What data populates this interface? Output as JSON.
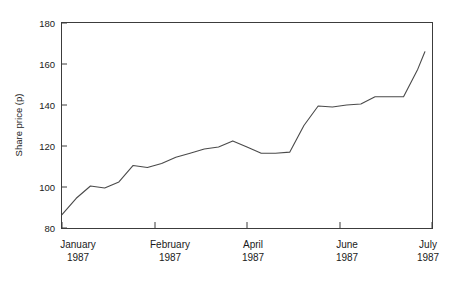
{
  "chart_data": {
    "type": "line",
    "title": "",
    "xlabel": "",
    "ylabel": "Share price (p)",
    "ylim": [
      80,
      180
    ],
    "xlim": [
      0,
      26
    ],
    "yticks": [
      80,
      100,
      120,
      140,
      160,
      180
    ],
    "ytick_labels": [
      "80",
      "100",
      "120",
      "140",
      "160",
      "180"
    ],
    "grid": false,
    "legend": null,
    "x_category_ticks": [
      0,
      6.5,
      12.75,
      19.25,
      25.5
    ],
    "x_categories": [
      {
        "month": "January",
        "year": "1987"
      },
      {
        "month": "February",
        "year": "1987"
      },
      {
        "month": "April",
        "year": "1987"
      },
      {
        "month": "June",
        "year": "1987"
      },
      {
        "month": "July",
        "year": "1987"
      }
    ],
    "series": [
      {
        "name": "Share price",
        "x": [
          0,
          1,
          2,
          3,
          4,
          5,
          6,
          7,
          8,
          9,
          10,
          11,
          12,
          13,
          14,
          15,
          16,
          17,
          18,
          19,
          20,
          21,
          22,
          23,
          24,
          25,
          25.5
        ],
        "values": [
          86.5,
          94.5,
          100.5,
          99.5,
          102.5,
          110.5,
          109.5,
          111.5,
          114.5,
          116.5,
          118.5,
          119.5,
          122.5,
          119.5,
          116.5,
          116.5,
          117.0,
          130.0,
          139.5,
          139.0,
          140.0,
          140.5,
          144.0,
          144.0,
          144.0,
          157.5,
          166.0
        ]
      }
    ]
  },
  "axis": {
    "y_axis_title": "Share price (p)"
  }
}
